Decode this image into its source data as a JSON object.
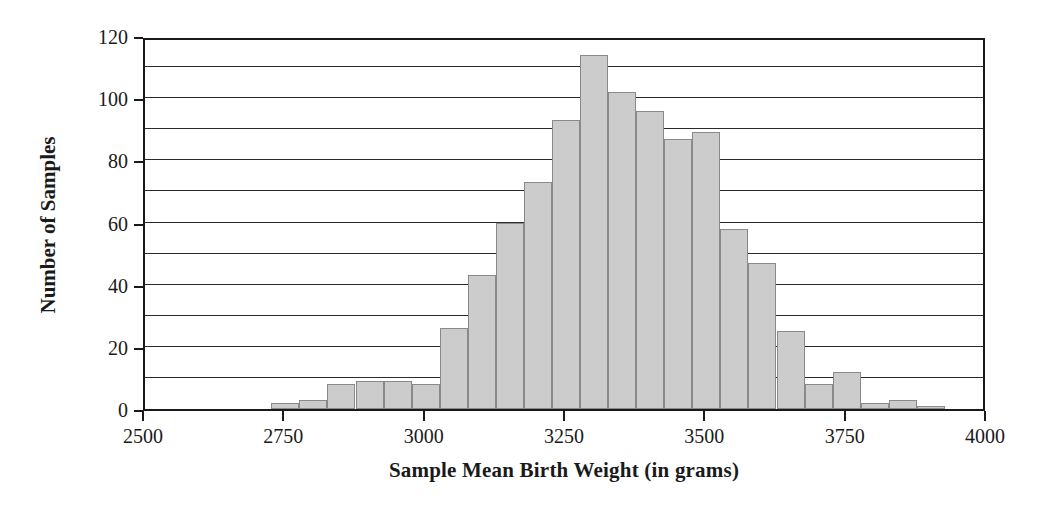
{
  "chart_data": {
    "type": "bar",
    "title": "",
    "xlabel": "Sample Mean Birth Weight (in grams)",
    "ylabel": "Number of Samples",
    "xlim": [
      2500,
      4000
    ],
    "ylim": [
      0,
      120
    ],
    "xticks": [
      2500,
      2750,
      3000,
      3250,
      3500,
      3750,
      4000
    ],
    "yticks": [
      0,
      20,
      40,
      60,
      80,
      100,
      120
    ],
    "gridlines_y": [
      10,
      20,
      30,
      40,
      50,
      60,
      70,
      80,
      90,
      100,
      110
    ],
    "grid": "horizontal",
    "legend": "none",
    "bin_width": 50,
    "bar_color": "#cccccc",
    "bar_edge_color": "#8a8a8a",
    "bin_starts": [
      2725,
      2775,
      2825,
      2875,
      2925,
      2975,
      3025,
      3075,
      3125,
      3175,
      3225,
      3275,
      3325,
      3375,
      3425,
      3475,
      3525,
      3575,
      3625,
      3675,
      3725,
      3775,
      3825,
      3875
    ],
    "categories": [
      "2725-2775",
      "2775-2825",
      "2825-2875",
      "2875-2925",
      "2925-2975",
      "2975-3025",
      "3025-3075",
      "3075-3125",
      "3125-3175",
      "3175-3225",
      "3225-3275",
      "3275-3325",
      "3325-3375",
      "3375-3425",
      "3425-3475",
      "3475-3525",
      "3525-3575",
      "3575-3625",
      "3625-3675",
      "3675-3725",
      "3725-3775",
      "3775-3825",
      "3825-3875",
      "3875-3925"
    ],
    "values": [
      2,
      3,
      8,
      9,
      9,
      8,
      26,
      43,
      60,
      73,
      93,
      114,
      102,
      96,
      87,
      89,
      58,
      47,
      25,
      8,
      12,
      2,
      3,
      1
    ]
  },
  "axis": {
    "y_title": "Number of Samples",
    "x_title": "Sample Mean Birth Weight (in grams)",
    "y_tick_labels": [
      "0",
      "20",
      "40",
      "60",
      "80",
      "100",
      "120"
    ],
    "x_tick_labels": [
      "2500",
      "2750",
      "3000",
      "3250",
      "3500",
      "3750",
      "4000"
    ]
  }
}
